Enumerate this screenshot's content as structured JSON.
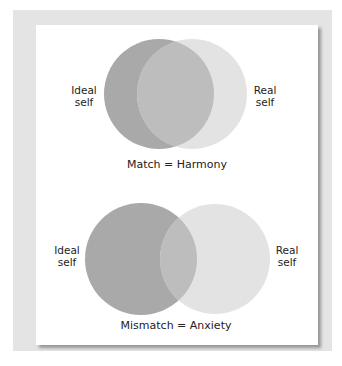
{
  "panels": [
    {
      "id": "match",
      "caption": "Match = Harmony",
      "left_label": {
        "line1": "Ideal",
        "line2": "self"
      },
      "right_label": {
        "line1": "Real",
        "line2": "self"
      }
    },
    {
      "id": "mismatch",
      "caption": "Mismatch = Anxiety",
      "left_label": {
        "line1": "Ideal",
        "line2": "self"
      },
      "right_label": {
        "line1": "Real",
        "line2": "self"
      }
    }
  ],
  "colors": {
    "ideal_circle": "#a9a9a9",
    "real_circle": "#e3e3e3",
    "overlap": "#bdbdbd",
    "frame": "#e4e4e4",
    "card": "#ffffff"
  }
}
